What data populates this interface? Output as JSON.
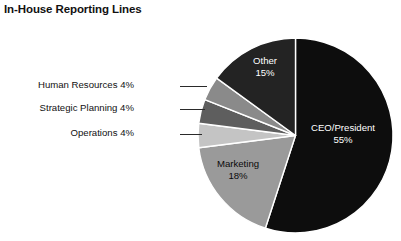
{
  "title": "In-House Reporting Lines",
  "chart_data": {
    "type": "pie",
    "title": "In-House Reporting Lines",
    "xlabel": "",
    "ylabel": "",
    "units": "percent",
    "legend_position": "none",
    "grid": false,
    "start_angle_deg": 0,
    "direction": "clockwise",
    "categories": [
      "CEO/President",
      "Marketing",
      "Operations",
      "Strategic Planning",
      "Human Resources",
      "Other"
    ],
    "values": [
      55,
      18,
      4,
      4,
      4,
      15
    ],
    "slices": [
      {
        "name": "CEO/President",
        "value": 55,
        "label_line1": "CEO/President",
        "label_line2": "55%",
        "color": "#0d0d0d",
        "label_placement": "inside",
        "label_color": "#ffffff"
      },
      {
        "name": "Marketing",
        "value": 18,
        "label_line1": "Marketing",
        "label_line2": "18%",
        "color": "#9a9a9a",
        "label_placement": "inside",
        "label_color": "#0a0a0a"
      },
      {
        "name": "Operations",
        "value": 4,
        "label_line1": "Operations 4%",
        "label_line2": "",
        "color": "#c4c4c4",
        "label_placement": "outside-left",
        "label_color": "#111111"
      },
      {
        "name": "Strategic Planning",
        "value": 4,
        "label_line1": "Strategic Planning 4%",
        "label_line2": "",
        "color": "#5e5e5e",
        "label_placement": "outside-left",
        "label_color": "#111111"
      },
      {
        "name": "Human Resources",
        "value": 4,
        "label_line1": "Human Resources 4%",
        "label_line2": "",
        "color": "#8a8a8a",
        "label_placement": "outside-left",
        "label_color": "#111111"
      },
      {
        "name": "Other",
        "value": 15,
        "label_line1": "Other",
        "label_line2": "15%",
        "color": "#232323",
        "label_placement": "inside",
        "label_color": "#ffffff"
      }
    ]
  },
  "callouts": {
    "human_resources": "Human Resources 4%",
    "strategic_planning": "Strategic Planning 4%",
    "operations": "Operations 4%"
  },
  "inside_labels": {
    "other_line1": "Other",
    "other_line2": "15%",
    "ceo_line1": "CEO/President",
    "ceo_line2": "55%",
    "marketing_line1": "Marketing",
    "marketing_line2": "18%"
  },
  "colors": {
    "background": "#ffffff",
    "slice_border": "#ffffff",
    "text": "#111111",
    "ceo": "#0d0d0d",
    "marketing": "#9a9a9a",
    "operations": "#c4c4c4",
    "strategic_planning": "#5e5e5e",
    "human_resources": "#8a8a8a",
    "other": "#232323"
  }
}
